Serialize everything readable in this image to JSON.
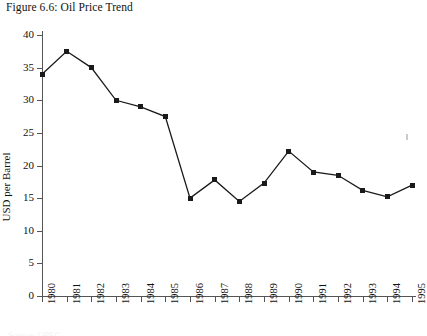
{
  "caption": "Figure 6.6: Oil Price Trend",
  "footer_partial": "Source: OPEC",
  "colors": {
    "line": "#1a1a1a",
    "axis": "#555555",
    "background": "#ffffff"
  },
  "chart_data": {
    "type": "line",
    "title": "Figure 6.6: Oil Price Trend",
    "xlabel": "",
    "ylabel": "USD per Barrel",
    "categories": [
      "1980",
      "1981",
      "1982",
      "1983",
      "1984",
      "1985",
      "1986",
      "1987",
      "1988",
      "1989",
      "1990",
      "1991",
      "1992",
      "1993",
      "1994",
      "1995"
    ],
    "values": [
      34,
      37.5,
      35,
      30,
      29,
      27.5,
      15,
      17.8,
      14.5,
      17.3,
      22.2,
      19,
      18.5,
      16.2,
      15.2,
      17
    ],
    "ylim": [
      0,
      40
    ],
    "yticks": [
      0,
      5,
      10,
      15,
      20,
      25,
      30,
      35,
      40
    ],
    "ytick_labels": [
      "0",
      "5",
      "10",
      "15",
      "20",
      "25",
      "30",
      "35",
      "40"
    ],
    "grid": false,
    "legend": false,
    "marker": "square",
    "series": [
      {
        "name": "Oil Price",
        "values": [
          34,
          37.5,
          35,
          30,
          29,
          27.5,
          15,
          17.8,
          14.5,
          17.3,
          22.2,
          19,
          18.5,
          16.2,
          15.2,
          17
        ]
      }
    ]
  }
}
